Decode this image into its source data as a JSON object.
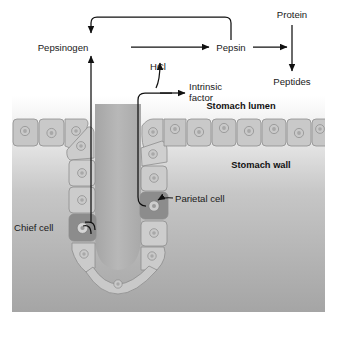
{
  "figure": {
    "width": 340,
    "height": 352
  },
  "colors": {
    "line": "#111111",
    "text": "#1a1a1a",
    "lumen_background_top": "#ffffff",
    "wall_background": "#a9a9a9",
    "epithelium_fill": "#c4c4c4",
    "gland_cell_fill": "#cfcfcf",
    "secretory_cell_fill": "#8c8c8c",
    "lumen_channel_fill": "#b4b4b4"
  },
  "pathway": {
    "nodes": [
      {
        "id": "pepsinogen",
        "label": "Pepsinogen"
      },
      {
        "id": "hcl",
        "label": "HCl"
      },
      {
        "id": "pepsin",
        "label": "Pepsin"
      },
      {
        "id": "intrinsic_factor_line1",
        "label": "Intrinsic"
      },
      {
        "id": "intrinsic_factor_line2",
        "label": "factor"
      },
      {
        "id": "protein",
        "label": "Protein"
      },
      {
        "id": "peptides",
        "label": "Peptides"
      }
    ],
    "arrows": [
      {
        "id": "pepsinogen-to-pepsin",
        "from": "Pepsinogen",
        "to": "Pepsin"
      },
      {
        "id": "pepsin-feedback-to-pepsinogen",
        "from": "Pepsin",
        "to": "Pepsinogen"
      },
      {
        "id": "hcl-activates-pepsinogen",
        "from": "HCl",
        "to": "Pepsinogen conversion"
      },
      {
        "id": "pepsin-to-protein-digestion",
        "from": "Pepsin",
        "to": "Protein"
      },
      {
        "id": "protein-to-peptides",
        "from": "Protein",
        "to": "Peptides"
      },
      {
        "id": "chief-cell-to-pepsinogen",
        "from": "Chief cell",
        "to": "Pepsinogen"
      },
      {
        "id": "parietal-cell-to-hcl",
        "from": "Parietal cell",
        "to": "HCl"
      },
      {
        "id": "parietal-cell-to-intrinsic-factor",
        "from": "Parietal cell",
        "to": "Intrinsic factor"
      }
    ]
  },
  "regions": [
    {
      "id": "stomach-lumen",
      "label": "Stomach lumen"
    },
    {
      "id": "stomach-wall",
      "label": "Stomach wall"
    }
  ],
  "cells": [
    {
      "id": "chief-cell",
      "label": "Chief cell",
      "secretes": "Pepsinogen"
    },
    {
      "id": "parietal-cell",
      "label": "Parietal cell",
      "secretes": "HCl and intrinsic factor"
    }
  ]
}
